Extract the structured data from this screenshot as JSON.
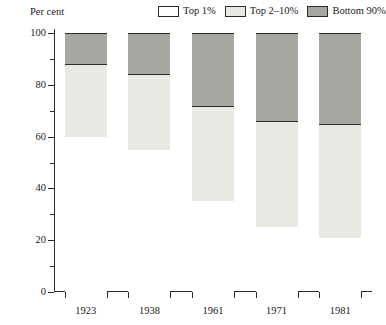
{
  "chart_data": {
    "type": "bar",
    "subtype": "stacked-percentage-column",
    "title": "",
    "xlabel": "",
    "ylabel": "Per cent",
    "ylim": [
      0,
      100
    ],
    "y_major_ticks": [
      0,
      20,
      40,
      60,
      80,
      100
    ],
    "y_minor_ticks": [
      10,
      30,
      50,
      70,
      90
    ],
    "grid": false,
    "legend_position": "top-right",
    "categories": [
      "1923",
      "1938",
      "1961",
      "1971",
      "1981"
    ],
    "series": [
      {
        "name": "Top 1%",
        "color": "#ffffff",
        "values": [
          60,
          55,
          35,
          25,
          21
        ]
      },
      {
        "name": "Top 2–10%",
        "color": "#e9e9e4",
        "values": [
          28,
          29,
          37,
          41,
          44
        ]
      },
      {
        "name": "Bottom 90%",
        "color": "#a8a8a3",
        "values": [
          12,
          16,
          28,
          34,
          35
        ]
      }
    ],
    "cumulative_boundaries": [
      {
        "category": "1923",
        "top1_upper": 60,
        "top210_upper": 88
      },
      {
        "category": "1938",
        "top1_upper": 55,
        "top210_upper": 84
      },
      {
        "category": "1961",
        "top1_upper": 35,
        "top210_upper": 72
      },
      {
        "category": "1971",
        "top1_upper": 25,
        "top210_upper": 66
      },
      {
        "category": "1981",
        "top1_upper": 21,
        "top210_upper": 65
      }
    ]
  },
  "axis": {
    "y_title": "Per cent",
    "y_tick_labels": [
      "0",
      "20",
      "40",
      "60",
      "80",
      "100"
    ],
    "x_tick_labels": [
      "1923",
      "1938",
      "1961",
      "1971",
      "1981"
    ]
  },
  "legend": {
    "entries": [
      {
        "label": "Top 1%"
      },
      {
        "label": "Top 2–10%"
      },
      {
        "label": "Bottom 90%"
      }
    ]
  }
}
